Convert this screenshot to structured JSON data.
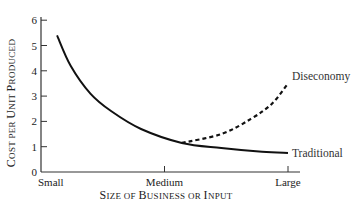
{
  "chart_data": {
    "type": "line",
    "title": "",
    "xlabel": "Size of Business or Input",
    "ylabel": "Cost per Unit Produced",
    "categories": [
      "Small",
      "Medium",
      "Large"
    ],
    "yticks": [
      "0",
      "1",
      "2",
      "3",
      "4",
      "5",
      "6"
    ],
    "ylim": [
      0,
      6
    ],
    "grid": false,
    "legend": "inline labels at line ends",
    "series": [
      {
        "name": "Traditional",
        "style": "solid",
        "points": [
          {
            "x": 0.13,
            "y": 5.4
          },
          {
            "x": 0.24,
            "y": 4.2
          },
          {
            "x": 0.4,
            "y": 3.1
          },
          {
            "x": 0.57,
            "y": 2.4
          },
          {
            "x": 0.81,
            "y": 1.7
          },
          {
            "x": 1.14,
            "y": 1.15
          },
          {
            "x": 1.46,
            "y": 0.95
          },
          {
            "x": 1.79,
            "y": 0.8
          },
          {
            "x": 2.0,
            "y": 0.75
          }
        ]
      },
      {
        "name": "Diseconomy",
        "style": "dashed",
        "points": [
          {
            "x": 1.14,
            "y": 1.15
          },
          {
            "x": 1.46,
            "y": 1.5
          },
          {
            "x": 1.7,
            "y": 2.1
          },
          {
            "x": 1.87,
            "y": 2.7
          },
          {
            "x": 2.0,
            "y": 3.5
          }
        ]
      }
    ]
  },
  "labels": {
    "x_title_parts": [
      {
        "big": "S",
        "small": "IZE OF "
      },
      {
        "big": "B",
        "small": "USINESS OR "
      },
      {
        "big": "I",
        "small": "NPUT"
      }
    ],
    "y_title_parts": [
      {
        "big": "C",
        "small": "OST PER "
      },
      {
        "big": "U",
        "small": "NIT "
      },
      {
        "big": "P",
        "small": "RODUCED"
      }
    ]
  }
}
